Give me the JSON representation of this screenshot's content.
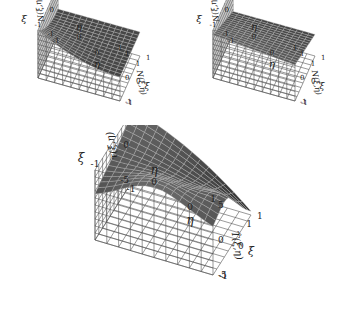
{
  "chart_data": [
    {
      "type": "surface3d",
      "position": "top-left",
      "title": "",
      "xlabel": "η",
      "ylabel": "ξ",
      "zlabel": "N(ξ,η)",
      "zlabel_right": "N(ξ,η)",
      "x_ticks": [
        "-1",
        "0",
        "1"
      ],
      "y_ticks": [
        "-1",
        "0",
        "1"
      ],
      "z_ticks": [
        "-1",
        "0",
        "1"
      ],
      "xlim": [
        -1,
        1
      ],
      "ylim": [
        -1,
        1
      ],
      "zlim": [
        -1,
        1
      ],
      "description": "Bilinear shape function, peak value 1 at corner (ξ=-1, η=-1), decaying to 0 elsewhere",
      "grid": true,
      "surface_color": "#4a4a4a"
    },
    {
      "type": "surface3d",
      "position": "top-right",
      "title": "",
      "xlabel": "η",
      "ylabel": "ξ",
      "zlabel": "N(ξ,η)",
      "zlabel_right": "N(ξ,η)",
      "x_ticks": [
        "-1",
        "0",
        "1"
      ],
      "y_ticks": [
        "-1",
        "0",
        "1"
      ],
      "z_ticks": [
        "-1",
        "0",
        "1"
      ],
      "xlim": [
        -1,
        1
      ],
      "ylim": [
        -1,
        1
      ],
      "zlim": [
        -1,
        1
      ],
      "description": "Quadratic edge shape function, ~1 along the ξ=-1 edge at η=-1 side, decreasing toward 0",
      "grid": true,
      "surface_color": "#4a4a4a"
    },
    {
      "type": "surface3d",
      "position": "bottom-center",
      "title": "",
      "xlabel": "η",
      "ylabel": "ξ",
      "zlabel": "τ(ξ,η)",
      "zlabel_right": "T̂(ξ,η)",
      "x_ticks": [
        "-1",
        "0",
        "1"
      ],
      "y_ticks": [
        "-1",
        "0",
        "1"
      ],
      "z_ticks": [
        "-5",
        "0",
        "5"
      ],
      "xlim": [
        -1,
        1
      ],
      "ylim": [
        -1,
        1
      ],
      "zlim": [
        -5,
        5
      ],
      "description": "Saddle-like surface, ~5 at corner (η=-1, ξ=1), ~5 ridge near (ξ=-1, η=0), dips to ~-5 near (η=1, ξ=1)",
      "grid": true,
      "surface_color": "#3a3a3a"
    }
  ]
}
